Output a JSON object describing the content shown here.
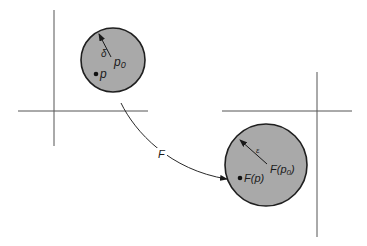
{
  "diagram": {
    "type": "continuity-neighborhood-mapping",
    "domain_space": {
      "axes": {
        "horizontal_label": "",
        "vertical_label": ""
      },
      "disk": {
        "center_label": "p",
        "center_subscript": "0",
        "radius_label": "δ",
        "point_label": "p"
      }
    },
    "target_space": {
      "axes": {
        "horizontal_label": "",
        "vertical_label": ""
      },
      "disk": {
        "center_label_prefix": "F(p",
        "center_subscript": "0",
        "center_label_suffix": ")",
        "radius_label": "ε",
        "point_label": "F(p)"
      }
    },
    "mapping": {
      "label": "F"
    },
    "colors": {
      "disk_fill": "#a9a9a9",
      "disk_outline": "#1f1f1f",
      "axis": "#555555",
      "background": "#ffffff"
    }
  }
}
